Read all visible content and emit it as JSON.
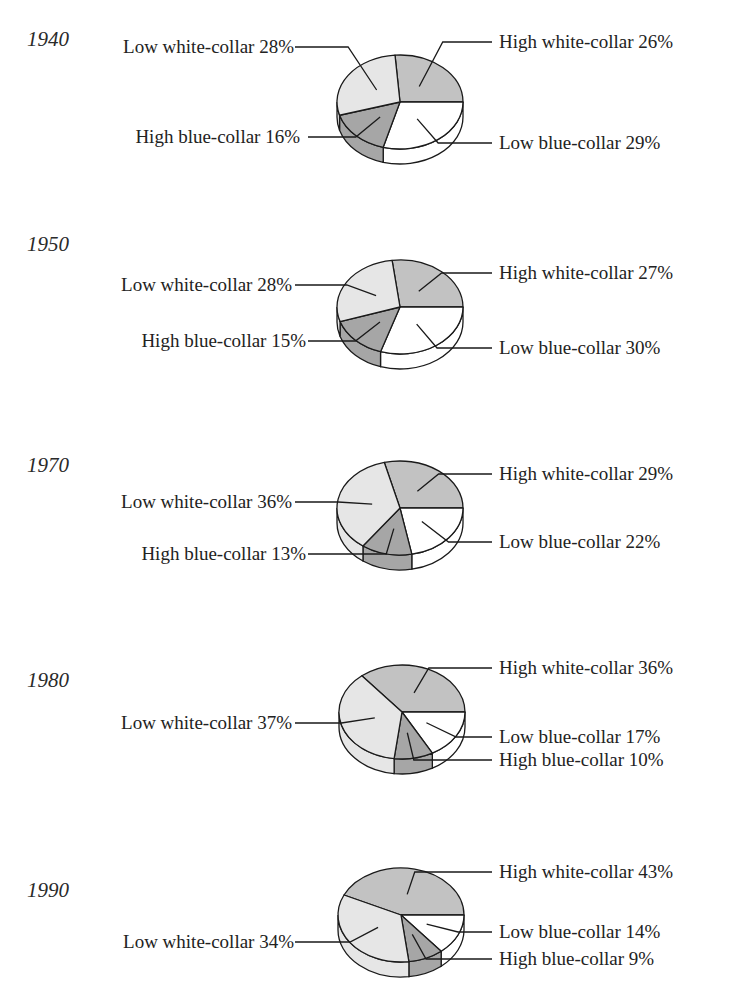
{
  "chart_data": [
    {
      "type": "pie",
      "title": "1940",
      "categories": [
        "High white-collar",
        "Low blue-collar",
        "High blue-collar",
        "Low white-collar"
      ],
      "values": [
        26,
        29,
        16,
        28
      ],
      "labels": [
        "High white-collar 26%",
        "Low blue-collar 29%",
        "High blue-collar 16%",
        "Low white-collar 28%"
      ]
    },
    {
      "type": "pie",
      "title": "1950",
      "categories": [
        "High white-collar",
        "Low blue-collar",
        "High blue-collar",
        "Low white-collar"
      ],
      "values": [
        27,
        30,
        15,
        28
      ],
      "labels": [
        "High white-collar 27%",
        "Low blue-collar 30%",
        "High blue-collar 15%",
        "Low white-collar 28%"
      ]
    },
    {
      "type": "pie",
      "title": "1970",
      "categories": [
        "High white-collar",
        "Low blue-collar",
        "High blue-collar",
        "Low white-collar"
      ],
      "values": [
        29,
        22,
        13,
        36
      ],
      "labels": [
        "High white-collar 29%",
        "Low blue-collar 22%",
        "High blue-collar 13%",
        "Low white-collar 36%"
      ]
    },
    {
      "type": "pie",
      "title": "1980",
      "categories": [
        "High white-collar",
        "Low blue-collar",
        "High blue-collar",
        "Low white-collar"
      ],
      "values": [
        36,
        17,
        10,
        37
      ],
      "labels": [
        "High white-collar 36%",
        "Low blue-collar 17%",
        "High blue-collar 10%",
        "Low white-collar 37%"
      ]
    },
    {
      "type": "pie",
      "title": "1990",
      "categories": [
        "High white-collar",
        "Low blue-collar",
        "High blue-collar",
        "Low white-collar"
      ],
      "values": [
        43,
        14,
        9,
        34
      ],
      "labels": [
        "High white-collar 43%",
        "Low blue-collar 14%",
        "High blue-collar 9%",
        "Low white-collar 34%"
      ]
    }
  ],
  "colors": {
    "High white-collar": "#c2c2c2",
    "Low blue-collar": "#ffffff",
    "High blue-collar": "#a6a6a6",
    "Low white-collar": "#e6e6e6",
    "outline": "#1a1a1a"
  },
  "layout": [
    {
      "year_y": 27,
      "cx": 400,
      "cy": 102,
      "label_y": {
        "High white-collar": 31,
        "Low white-collar": 36,
        "High blue-collar": 126,
        "Low blue-collar": 132
      }
    },
    {
      "year_y": 232,
      "cx": 400,
      "cy": 307,
      "label_y": {
        "High white-collar": 262,
        "Low white-collar": 274,
        "High blue-collar": 330,
        "Low blue-collar": 337
      }
    },
    {
      "year_y": 453,
      "cx": 400,
      "cy": 508,
      "label_y": {
        "High white-collar": 463,
        "Low white-collar": 491,
        "High blue-collar": 543,
        "Low blue-collar": 531
      }
    },
    {
      "year_y": 668,
      "cx": 402,
      "cy": 712,
      "label_y": {
        "High white-collar": 657,
        "Low white-collar": 712,
        "High blue-collar": 749,
        "Low blue-collar": 726
      }
    },
    {
      "year_y": 878,
      "cx": 401,
      "cy": 915,
      "label_y": {
        "High white-collar": 861,
        "Low white-collar": 931,
        "High blue-collar": 948,
        "Low blue-collar": 921
      }
    }
  ]
}
